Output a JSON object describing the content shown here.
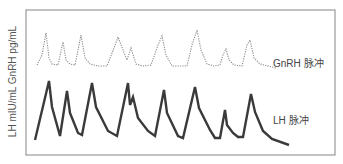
{
  "chart_data": {
    "type": "line",
    "title": "",
    "xlabel": "",
    "ylabel": "LH mIU/mL GnRH pg/mL",
    "grid": false,
    "legend_position": "inline-right",
    "frame": {
      "x": 26,
      "y": 10,
      "width": 309,
      "height": 145,
      "color": "#999999"
    },
    "series": [
      {
        "name": "GnRH 脉冲",
        "style": "dotted",
        "color": "#8a8a8a",
        "points": [
          [
            37,
            65
          ],
          [
            42,
            55
          ],
          [
            46,
            33
          ],
          [
            49,
            58
          ],
          [
            52,
            64
          ],
          [
            58,
            65
          ],
          [
            63,
            42
          ],
          [
            66,
            60
          ],
          [
            70,
            64
          ],
          [
            75,
            65
          ],
          [
            81,
            35
          ],
          [
            85,
            58
          ],
          [
            90,
            64
          ],
          [
            98,
            66
          ],
          [
            107,
            66
          ],
          [
            114,
            48
          ],
          [
            118,
            37
          ],
          [
            123,
            50
          ],
          [
            127,
            60
          ],
          [
            131,
            48
          ],
          [
            136,
            64
          ],
          [
            143,
            66
          ],
          [
            151,
            65
          ],
          [
            158,
            45
          ],
          [
            162,
            36
          ],
          [
            166,
            55
          ],
          [
            172,
            66
          ],
          [
            187,
            66
          ],
          [
            192,
            45
          ],
          [
            197,
            30
          ],
          [
            201,
            50
          ],
          [
            207,
            64
          ],
          [
            214,
            66
          ],
          [
            220,
            65
          ],
          [
            223,
            55
          ],
          [
            226,
            49
          ],
          [
            229,
            60
          ],
          [
            234,
            65
          ],
          [
            242,
            66
          ],
          [
            247,
            45
          ],
          [
            250,
            40
          ],
          [
            254,
            58
          ],
          [
            260,
            64
          ],
          [
            276,
            68
          ]
        ]
      },
      {
        "name": "LH 脉冲",
        "style": "solid",
        "color": "#3a3a3a",
        "points": [
          [
            35,
            140
          ],
          [
            49,
            81
          ],
          [
            52,
            107
          ],
          [
            60,
            136
          ],
          [
            67,
            91
          ],
          [
            70,
            113
          ],
          [
            78,
            133
          ],
          [
            82,
            135
          ],
          [
            92,
            83
          ],
          [
            96,
            107
          ],
          [
            108,
            131
          ],
          [
            117,
            136
          ],
          [
            128,
            83
          ],
          [
            130,
            105
          ],
          [
            133,
            97
          ],
          [
            138,
            118
          ],
          [
            148,
            131
          ],
          [
            155,
            136
          ],
          [
            164,
            90
          ],
          [
            167,
            113
          ],
          [
            178,
            136
          ],
          [
            183,
            138
          ],
          [
            195,
            87
          ],
          [
            199,
            108
          ],
          [
            210,
            130
          ],
          [
            215,
            138
          ],
          [
            220,
            138
          ],
          [
            225,
            110
          ],
          [
            227,
            125
          ],
          [
            233,
            133
          ],
          [
            238,
            137
          ],
          [
            243,
            137
          ],
          [
            251,
            94
          ],
          [
            255,
            112
          ],
          [
            263,
            131
          ],
          [
            272,
            139
          ],
          [
            289,
            145
          ]
        ]
      }
    ],
    "annotations": [
      {
        "text": "GnRH 脉冲",
        "x": 273,
        "y": 55
      },
      {
        "text": "LH 脉冲",
        "x": 273,
        "y": 112
      }
    ]
  },
  "labels": {
    "yaxis": "LH mIU/mL GnRH pg/mL",
    "gnrh": "GnRH 脉冲",
    "lh": "LH 脉冲"
  }
}
